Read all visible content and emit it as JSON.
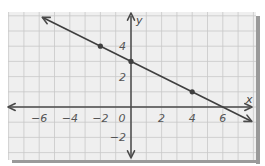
{
  "chart_data": {
    "type": "line",
    "title": "",
    "xlabel": "x",
    "ylabel": "y",
    "xlim": [
      -8,
      8
    ],
    "ylim": [
      -3.5,
      6.3
    ],
    "grid": true,
    "grid_step": 1,
    "x_ticks": [
      -6,
      -4,
      -2,
      0,
      2,
      4,
      6
    ],
    "x_tick_labels": [
      "−6",
      "−4",
      "−2",
      "0",
      "2",
      "4",
      "6"
    ],
    "y_ticks": [
      -2,
      2,
      4
    ],
    "y_tick_labels": [
      "−2",
      "2",
      "4"
    ],
    "series": [
      {
        "name": "line",
        "equation": "y = -x/2 + 3",
        "slope": -0.5,
        "intercept": 3,
        "marked_points": [
          {
            "x": -2,
            "y": 4
          },
          {
            "x": 0,
            "y": 3
          },
          {
            "x": 4,
            "y": 1
          }
        ],
        "arrows_both_ends": true
      }
    ],
    "legend": null
  },
  "colors": {
    "paper": "#efefef",
    "grid": "#c8c8c8",
    "axis": "#4a4a4a",
    "line": "#3f3f3f",
    "shadow": "#9a9a9a",
    "label": "#555555"
  }
}
